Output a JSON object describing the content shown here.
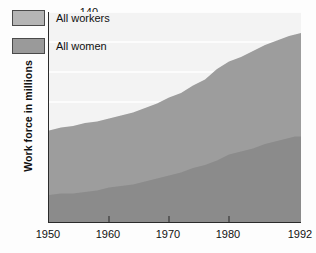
{
  "chart_data": {
    "type": "area",
    "title": "",
    "xlabel": "",
    "ylabel": "Work force in millions",
    "xlim": [
      1950,
      1992
    ],
    "ylim": [
      0,
      140
    ],
    "grid": true,
    "stacked": false,
    "legend_position": "top-left",
    "yticks": [
      20,
      40,
      60,
      80,
      100,
      120,
      140
    ],
    "xticks": [
      1950,
      1960,
      1970,
      1980,
      1992
    ],
    "xtick_labels": [
      "1950",
      "1960",
      "1970",
      "1980",
      "1992"
    ],
    "ytick_labels": [
      "20",
      "40",
      "60",
      "80",
      "100",
      "120",
      "140"
    ],
    "x": [
      1950,
      1952,
      1954,
      1956,
      1958,
      1960,
      1962,
      1964,
      1966,
      1968,
      1970,
      1972,
      1974,
      1976,
      1978,
      1980,
      1982,
      1984,
      1986,
      1988,
      1990,
      1991,
      1992
    ],
    "series": [
      {
        "name": "All workers",
        "color": "#9d9d9d",
        "values": [
          61,
          63,
          64,
          66,
          67,
          69,
          71,
          73,
          76,
          79,
          83,
          86,
          91,
          95,
          102,
          107,
          110,
          114,
          118,
          121,
          124,
          125,
          126
        ]
      },
      {
        "name": "All women",
        "color": "#8e8e8e",
        "values": [
          18,
          19,
          19,
          20,
          21,
          23,
          24,
          25,
          27,
          29,
          31,
          33,
          36,
          38,
          41,
          45,
          47,
          49,
          52,
          54,
          56,
          57,
          57
        ]
      }
    ],
    "colors": {
      "plot_background": "#f3f3f3",
      "gridline": "#ffffff",
      "axis": "#2b2b2b",
      "workers_fill": "#9d9d9d",
      "women_fill": "#8b8b8b",
      "text": "#111111"
    }
  },
  "legend": {
    "items": [
      {
        "label": "All workers",
        "swatch_color": "#b5b5b5"
      },
      {
        "label": "All women",
        "swatch_color": "#9a9a9a"
      }
    ]
  }
}
